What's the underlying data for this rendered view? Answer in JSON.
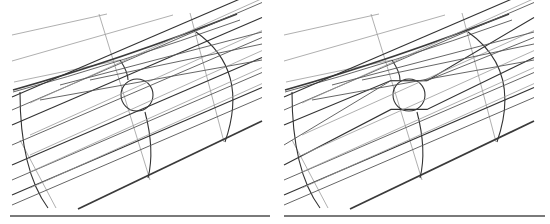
{
  "figure": {
    "panels": [
      {
        "id": "left",
        "label": "",
        "streamline_behavior": "straight-through"
      },
      {
        "id": "right",
        "label": "",
        "streamline_behavior": "deflected-around-circle"
      }
    ],
    "colors": {
      "background": "#ffffff",
      "line_dark": "#333333",
      "line_light": "#9a9a9a",
      "rule": "#7a7a7a"
    }
  }
}
